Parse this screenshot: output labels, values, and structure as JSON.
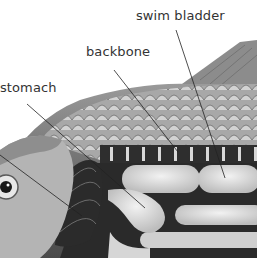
{
  "diagram": {
    "type": "labeled anatomical illustration",
    "labels": [
      {
        "text": "swim bladder",
        "x": 136,
        "y": 10,
        "line": [
          176,
          30,
          225,
          178
        ]
      },
      {
        "text": "backbone",
        "x": 86,
        "y": 46,
        "line": [
          114,
          70,
          178,
          152
        ]
      },
      {
        "text": "stomach",
        "x": 0,
        "y": 82,
        "line": [
          27,
          104,
          145,
          208
        ]
      }
    ],
    "extra_leader_lines": [
      [
        0,
        155,
        82,
        216
      ]
    ],
    "colors": {
      "background": "#ffffff",
      "label_text": "#333333",
      "leader_line": "#222222",
      "body_dark": "#3a3a3a",
      "body_mid": "#8a8a8a",
      "scale_light": "#c8c8c8",
      "organ_light": "#e4e4e4"
    }
  }
}
